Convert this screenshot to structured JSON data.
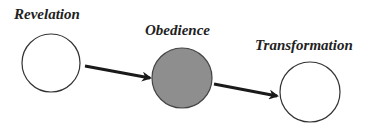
{
  "diagram": {
    "nodes": [
      {
        "id": "revelation",
        "label": "Revelation",
        "fill": "#ffffff"
      },
      {
        "id": "obedience",
        "label": "Obedience",
        "fill": "#8e8e8e"
      },
      {
        "id": "transformation",
        "label": "Transformation",
        "fill": "#ffffff"
      }
    ],
    "edges": [
      {
        "from": "revelation",
        "to": "obedience"
      },
      {
        "from": "obedience",
        "to": "transformation"
      }
    ],
    "stroke_color": "#333333",
    "arrow_color": "#1a1a1a"
  }
}
